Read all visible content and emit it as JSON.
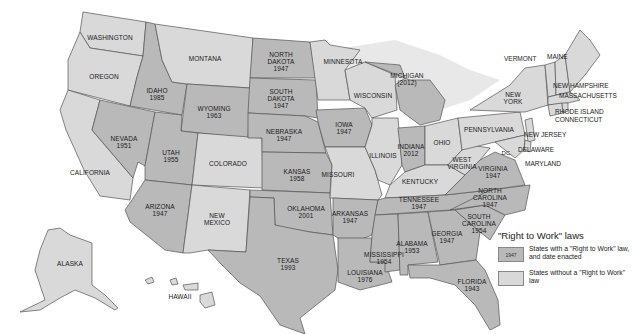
{
  "legend": {
    "title": "\"Right to Work\" laws",
    "with_law": {
      "swatch_label": "1947",
      "text": "States with a \"Right to Work\" law, and date enacted",
      "color": "#b9b9b9"
    },
    "without_law": {
      "text": "States without a \"Right to Work\" law",
      "color": "#d9d9d9"
    }
  },
  "states": {
    "washington": {
      "name": "WASHINGTON"
    },
    "oregon": {
      "name": "OREGON"
    },
    "california": {
      "name": "CALIFORNIA"
    },
    "idaho": {
      "name": "IDAHO",
      "year": "1985"
    },
    "nevada": {
      "name": "NEVADA",
      "year": "1951"
    },
    "montana": {
      "name": "MONTANA"
    },
    "wyoming": {
      "name": "WYOMING",
      "year": "1963"
    },
    "utah": {
      "name": "UTAH",
      "year": "1955"
    },
    "colorado": {
      "name": "COLORADO"
    },
    "arizona": {
      "name": "ARIZONA",
      "year": "1947"
    },
    "new_mexico": {
      "name": "NEW MEXICO"
    },
    "north_dakota": {
      "name": "NORTH DAKOTA",
      "year": "1947"
    },
    "south_dakota": {
      "name": "SOUTH DAKOTA",
      "year": "1947"
    },
    "nebraska": {
      "name": "NEBRASKA",
      "year": "1947"
    },
    "kansas": {
      "name": "KANSAS",
      "year": "1958"
    },
    "oklahoma": {
      "name": "OKLAHOMA",
      "year": "2001"
    },
    "texas": {
      "name": "TEXAS",
      "year": "1993"
    },
    "minnesota": {
      "name": "MINNESOTA"
    },
    "iowa": {
      "name": "IOWA",
      "year": "1947"
    },
    "missouri": {
      "name": "MISSOURI"
    },
    "arkansas": {
      "name": "ARKANSAS",
      "year": "1947"
    },
    "louisiana": {
      "name": "LOUISIANA",
      "year": "1976"
    },
    "wisconsin": {
      "name": "WISCONSIN"
    },
    "illinois": {
      "name": "ILLINOIS"
    },
    "michigan": {
      "name": "MICHIGAN",
      "year": "(2012)"
    },
    "indiana": {
      "name": "INDIANA",
      "year": "2012"
    },
    "ohio": {
      "name": "OHIO"
    },
    "kentucky": {
      "name": "KENTUCKY"
    },
    "tennessee": {
      "name": "TENNESSEE",
      "year": "1947"
    },
    "mississippi": {
      "name": "MISSISSIPPI",
      "year": "1954"
    },
    "alabama": {
      "name": "ALABAMA",
      "year": "1953"
    },
    "georgia": {
      "name": "GEORGIA",
      "year": "1947"
    },
    "florida": {
      "name": "FLORIDA",
      "year": "1943"
    },
    "south_carolina": {
      "name": "SOUTH CAROLINA",
      "year": "1954"
    },
    "north_carolina": {
      "name": "NORTH CAROLINA",
      "year": "1947"
    },
    "virginia": {
      "name": "VIRGINIA",
      "year": "1947"
    },
    "west_virginia": {
      "name": "WEST VIRGINIA"
    },
    "pennsylvania": {
      "name": "PENNSYLVANIA"
    },
    "new_york": {
      "name": "NEW YORK"
    },
    "vermont": {
      "name": "VERMONT"
    },
    "maine": {
      "name": "MAINE"
    },
    "new_hampshire": {
      "name": "NEW HAMPSHIRE"
    },
    "massachusetts": {
      "name": "MASSACHUSETTS"
    },
    "rhode_island": {
      "name": "RHODE ISLAND"
    },
    "connecticut": {
      "name": "CONNECTICUT"
    },
    "new_jersey": {
      "name": "NEW JERSEY"
    },
    "delaware": {
      "name": "DELAWARE"
    },
    "maryland": {
      "name": "MARYLAND"
    },
    "dc": {
      "name": "DC"
    },
    "alaska": {
      "name": "ALASKA"
    },
    "hawaii": {
      "name": "HAWAII"
    }
  }
}
